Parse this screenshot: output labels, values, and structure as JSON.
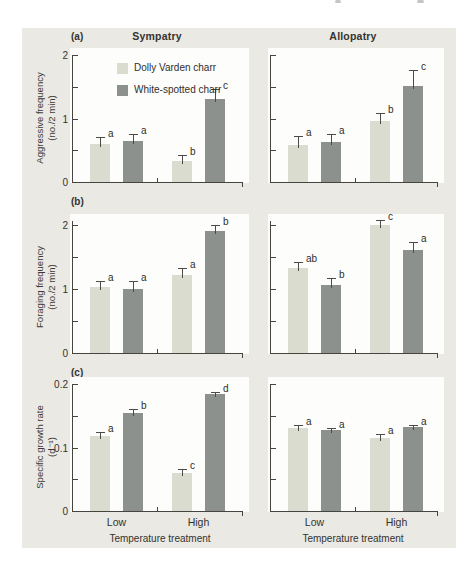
{
  "figure": {
    "column_titles": [
      "Sympatry",
      "Allopatry"
    ],
    "panel_letters": [
      "(a)",
      "(b)",
      "(c)"
    ],
    "rows": [
      {
        "letter": "(a)",
        "ylabel_line1": "Aggressive frequency",
        "ylabel_line2": "(no./2 min)"
      },
      {
        "letter": "(b)",
        "ylabel_line1": "Foraging frequency",
        "ylabel_line2": "(no./2 min)"
      },
      {
        "letter": "(c)",
        "ylabel_line1": "Specific growth rate",
        "ylabel_line2": "(d⁻¹)"
      }
    ],
    "x_axis_title": "Temperature treatment",
    "legend": {
      "items": [
        {
          "label": "Dolly Varden charr",
          "color": "#d9dccf"
        },
        {
          "label": "White-spotted charr",
          "color": "#8d918e"
        }
      ]
    },
    "colors": {
      "background": "#eae9e4",
      "plot_background": "#fdfdfb",
      "light_bar": "#d9dccf",
      "dark_bar": "#8d918e",
      "axis": "#45443f",
      "error_bar": "#4c4b47",
      "text": "#34332f"
    }
  },
  "chart_data": [
    {
      "type": "bar",
      "panel": "a",
      "location": "Sympatry",
      "title": "Sympatry",
      "ylabel": "Aggressive frequency (no./2 min)",
      "ylim": [
        0,
        2
      ],
      "categories": [
        "Low",
        "High"
      ],
      "xlabel": "",
      "yticks": [
        {
          "v": 0,
          "label": "0"
        },
        {
          "v": 0.5,
          "label": ""
        },
        {
          "v": 1,
          "label": "1"
        },
        {
          "v": 1.5,
          "label": ""
        },
        {
          "v": 2,
          "label": "2"
        }
      ],
      "xtick_labels": [],
      "legend_visible": true,
      "series": [
        {
          "name": "Dolly Varden charr",
          "color": "#d9dccf",
          "values": [
            0.6,
            0.33
          ],
          "errors": [
            0.11,
            0.1
          ],
          "letters": [
            "a",
            "b"
          ]
        },
        {
          "name": "White-spotted charr",
          "color": "#8d918e",
          "values": [
            0.65,
            1.31
          ],
          "errors": [
            0.1,
            0.15
          ],
          "letters": [
            "a",
            "c"
          ]
        }
      ]
    },
    {
      "type": "bar",
      "panel": "a",
      "location": "Allopatry",
      "title": "Allopatry",
      "ylabel": "Aggressive frequency (no./2 min)",
      "ylim": [
        0,
        2
      ],
      "categories": [
        "Low",
        "High"
      ],
      "xlabel": "",
      "yticks": [
        {
          "v": 0,
          "label": ""
        },
        {
          "v": 0.5,
          "label": ""
        },
        {
          "v": 1,
          "label": ""
        },
        {
          "v": 1.5,
          "label": ""
        },
        {
          "v": 2,
          "label": ""
        }
      ],
      "xtick_labels": [],
      "legend_visible": false,
      "series": [
        {
          "name": "Dolly Varden charr",
          "color": "#d9dccf",
          "values": [
            0.59,
            0.96
          ],
          "errors": [
            0.13,
            0.13
          ],
          "letters": [
            "a",
            "b"
          ]
        },
        {
          "name": "White-spotted charr",
          "color": "#8d918e",
          "values": [
            0.63,
            1.51
          ],
          "errors": [
            0.13,
            0.26
          ],
          "letters": [
            "a",
            "c"
          ]
        }
      ]
    },
    {
      "type": "bar",
      "panel": "b",
      "location": "Sympatry",
      "title": "",
      "ylabel": "Foraging frequency (no./2 min)",
      "ylim": [
        0,
        2
      ],
      "categories": [
        "Low",
        "High"
      ],
      "xlabel": "",
      "yticks": [
        {
          "v": 0,
          "label": "0"
        },
        {
          "v": 0.5,
          "label": ""
        },
        {
          "v": 1,
          "label": "1"
        },
        {
          "v": 1.5,
          "label": ""
        },
        {
          "v": 2,
          "label": "2"
        }
      ],
      "xtick_labels": [],
      "legend_visible": false,
      "series": [
        {
          "name": "Dolly Varden charr",
          "color": "#d9dccf",
          "values": [
            1.03,
            1.22
          ],
          "errors": [
            0.1,
            0.11
          ],
          "letters": [
            "a",
            "a"
          ]
        },
        {
          "name": "White-spotted charr",
          "color": "#8d918e",
          "values": [
            1.0,
            1.9
          ],
          "errors": [
            0.12,
            0.1
          ],
          "letters": [
            "a",
            "b"
          ]
        }
      ]
    },
    {
      "type": "bar",
      "panel": "b",
      "location": "Allopatry",
      "title": "",
      "ylabel": "Foraging frequency (no./2 min)",
      "ylim": [
        0,
        2
      ],
      "categories": [
        "Low",
        "High"
      ],
      "xlabel": "",
      "yticks": [
        {
          "v": 0,
          "label": ""
        },
        {
          "v": 0.5,
          "label": ""
        },
        {
          "v": 1,
          "label": ""
        },
        {
          "v": 1.5,
          "label": ""
        },
        {
          "v": 2,
          "label": ""
        }
      ],
      "xtick_labels": [],
      "legend_visible": false,
      "series": [
        {
          "name": "Dolly Varden charr",
          "color": "#d9dccf",
          "values": [
            1.33,
            2.0
          ],
          "errors": [
            0.09,
            0.08
          ],
          "letters": [
            "ab",
            "c"
          ]
        },
        {
          "name": "White-spotted charr",
          "color": "#8d918e",
          "values": [
            1.06,
            1.6
          ],
          "errors": [
            0.11,
            0.13
          ],
          "letters": [
            "b",
            "a"
          ]
        }
      ]
    },
    {
      "type": "bar",
      "panel": "c",
      "location": "Sympatry",
      "title": "",
      "ylabel": "Specific growth rate (d⁻¹)",
      "ylim": [
        0,
        0.2
      ],
      "categories": [
        "Low",
        "High"
      ],
      "xlabel": "Temperature treatment",
      "yticks": [
        {
          "v": 0,
          "label": "0"
        },
        {
          "v": 0.05,
          "label": ""
        },
        {
          "v": 0.1,
          "label": "0.1"
        },
        {
          "v": 0.15,
          "label": ""
        },
        {
          "v": 0.2,
          "label": "0.2"
        }
      ],
      "xtick_labels": [
        "Low",
        "High"
      ],
      "legend_visible": false,
      "series": [
        {
          "name": "Dolly Varden charr",
          "color": "#d9dccf",
          "values": [
            0.118,
            0.06
          ],
          "errors": [
            0.007,
            0.006
          ],
          "letters": [
            "a",
            "c"
          ]
        },
        {
          "name": "White-spotted charr",
          "color": "#8d918e",
          "values": [
            0.154,
            0.184
          ],
          "errors": [
            0.006,
            0.004
          ],
          "letters": [
            "b",
            "d"
          ]
        }
      ]
    },
    {
      "type": "bar",
      "panel": "c",
      "location": "Allopatry",
      "title": "",
      "ylabel": "Specific growth rate (d⁻¹)",
      "ylim": [
        0,
        0.2
      ],
      "categories": [
        "Low",
        "High"
      ],
      "xlabel": "Temperature treatment",
      "yticks": [
        {
          "v": 0,
          "label": ""
        },
        {
          "v": 0.05,
          "label": ""
        },
        {
          "v": 0.1,
          "label": ""
        },
        {
          "v": 0.15,
          "label": ""
        },
        {
          "v": 0.2,
          "label": ""
        }
      ],
      "xtick_labels": [
        "Low",
        "High"
      ],
      "legend_visible": false,
      "series": [
        {
          "name": "Dolly Varden charr",
          "color": "#d9dccf",
          "values": [
            0.13,
            0.115
          ],
          "errors": [
            0.005,
            0.007
          ],
          "letters": [
            "a",
            "a"
          ]
        },
        {
          "name": "White-spotted charr",
          "color": "#8d918e",
          "values": [
            0.127,
            0.132
          ],
          "errors": [
            0.004,
            0.003
          ],
          "letters": [
            "a",
            "a"
          ]
        }
      ]
    }
  ]
}
